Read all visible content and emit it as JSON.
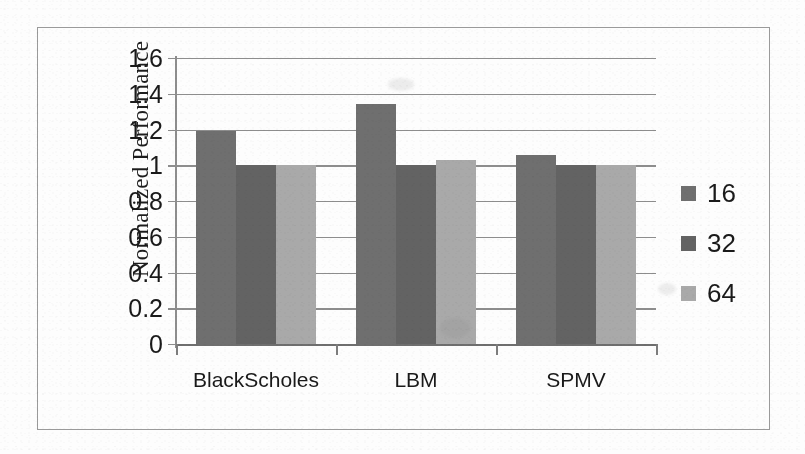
{
  "chart_data": {
    "type": "bar",
    "title": "",
    "subtitle": "",
    "xlabel": "",
    "ylabel": "Normalized Performance",
    "categories": [
      "BlackScholes",
      "LBM",
      "SPMV"
    ],
    "series": [
      {
        "name": "16",
        "values": [
          1.19,
          1.34,
          1.06
        ],
        "color": "#6f6f6f"
      },
      {
        "name": "32",
        "values": [
          1.0,
          1.0,
          1.0
        ],
        "color": "#636363"
      },
      {
        "name": "64",
        "values": [
          1.0,
          1.03,
          1.0
        ],
        "color": "#a9a9a9"
      }
    ],
    "ylim": [
      0,
      1.6
    ],
    "ytick_values": [
      0,
      0.2,
      0.4,
      0.6,
      0.8,
      1,
      1.2,
      1.4,
      1.6
    ],
    "ytick_labels": [
      "0",
      "0.2",
      "0.4",
      "0.6",
      "0.8",
      "1",
      "1.2",
      "1.4",
      "1.6"
    ],
    "grid": true,
    "grid_axis": "y",
    "legend_position": "right",
    "legend_entries": [
      "16",
      "32",
      "64"
    ],
    "bar_group_gap_ratio": 0.25
  },
  "colors": {
    "series_16": "#6f6f6f",
    "series_32": "#636363",
    "series_64": "#a9a9a9",
    "gridline": "#8d8d8d",
    "axis": "#8d8d8d",
    "frame_border": "#9a9a9a",
    "text": "#1a1a1a",
    "background": "#fdfdfd"
  }
}
